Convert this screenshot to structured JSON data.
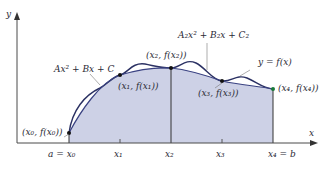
{
  "diagram": {
    "axes": {
      "x_label": "x",
      "y_label": "y"
    },
    "ticks": [
      "a = x₀",
      "x₁",
      "x₂",
      "x₃",
      "x₄ = b"
    ],
    "points": [
      {
        "label": "(x₀, f(x₀))"
      },
      {
        "label": "(x₁, f(x₁))"
      },
      {
        "label": "(x₂, f(x₂))"
      },
      {
        "label": "(x₃, f(x₃))"
      },
      {
        "label": "(x₄, f(x₄))"
      }
    ],
    "annotations": {
      "parabola1": "Ax² + Bx + C",
      "parabola2": "A₂x² + B₂x + C₂",
      "function": "y = f(x)"
    },
    "colors": {
      "fill": "#c9cde3",
      "curve": "#2b3163",
      "axis": "#4a4a4a",
      "text": "#2a2a35"
    }
  }
}
